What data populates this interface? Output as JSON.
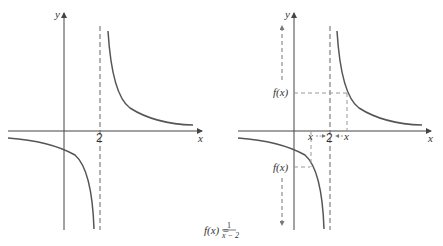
{
  "figure": {
    "function_label": "f(x) =",
    "function_numerator": "1",
    "function_denominator": "x − 2",
    "colors": {
      "axis": "#444444",
      "curve": "#555555",
      "dashed": "#999999",
      "text": "#333333"
    }
  },
  "left_graph": {
    "x_axis_label": "x",
    "y_axis_label": "y",
    "asymptote_label": "2"
  },
  "right_graph": {
    "x_axis_label": "x",
    "y_axis_label": "y",
    "asymptote_label": "2",
    "left_x_label": "x",
    "right_x_label": "x",
    "upper_value_label": "f(x)",
    "lower_value_label": "f(x)"
  }
}
